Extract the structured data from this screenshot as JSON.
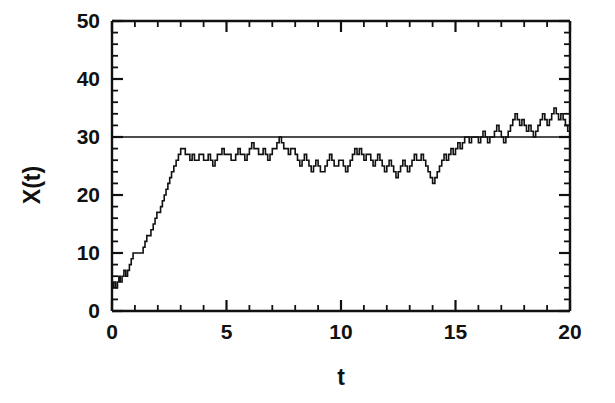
{
  "chart_data": {
    "type": "line",
    "title": "",
    "subtitle": "",
    "xlabel": "t",
    "ylabel": "X(t)",
    "xlim": [
      0,
      20
    ],
    "ylim": [
      0,
      50
    ],
    "xticks": [
      0,
      5,
      10,
      15,
      20
    ],
    "xtick_labels": [
      "0",
      "5",
      "10",
      "15",
      "20"
    ],
    "yticks": [
      0,
      10,
      20,
      30,
      40,
      50
    ],
    "ytick_labels": [
      "0",
      "10",
      "20",
      "30",
      "40",
      "50"
    ],
    "x_minor_tick_step": 1,
    "y_minor_tick_step": 2,
    "grid": false,
    "legend": "none",
    "line_color": "#111111",
    "line_width": 1.6,
    "step_style": "post",
    "annotations": [
      {
        "name": "equilibrium-line",
        "type": "hline",
        "y": 30,
        "label": "",
        "color": "#111111",
        "width": 1.6
      }
    ],
    "series": [
      {
        "name": "X(t)",
        "style": "step",
        "x": [
          0.0,
          0.08,
          0.16,
          0.24,
          0.3,
          0.36,
          0.44,
          0.52,
          0.6,
          0.68,
          0.76,
          0.84,
          0.92,
          1.0,
          1.08,
          1.18,
          1.28,
          1.36,
          1.44,
          1.52,
          1.6,
          1.7,
          1.8,
          1.88,
          1.96,
          2.04,
          2.12,
          2.2,
          2.28,
          2.36,
          2.44,
          2.52,
          2.6,
          2.7,
          2.8,
          2.9,
          3.0,
          3.1,
          3.2,
          3.3,
          3.4,
          3.5,
          3.6,
          3.7,
          3.8,
          3.9,
          4.0,
          4.1,
          4.2,
          4.3,
          4.4,
          4.5,
          4.6,
          4.7,
          4.8,
          4.9,
          5.0,
          5.1,
          5.2,
          5.3,
          5.4,
          5.5,
          5.6,
          5.7,
          5.8,
          5.9,
          6.0,
          6.1,
          6.2,
          6.3,
          6.4,
          6.5,
          6.6,
          6.7,
          6.8,
          6.9,
          7.0,
          7.1,
          7.2,
          7.3,
          7.4,
          7.5,
          7.6,
          7.7,
          7.8,
          7.9,
          8.0,
          8.1,
          8.2,
          8.3,
          8.4,
          8.5,
          8.6,
          8.7,
          8.8,
          8.9,
          9.0,
          9.1,
          9.2,
          9.3,
          9.4,
          9.5,
          9.6,
          9.7,
          9.8,
          9.9,
          10.0,
          10.1,
          10.2,
          10.3,
          10.4,
          10.5,
          10.6,
          10.7,
          10.8,
          10.9,
          11.0,
          11.1,
          11.2,
          11.3,
          11.4,
          11.5,
          11.6,
          11.7,
          11.8,
          11.9,
          12.0,
          12.1,
          12.2,
          12.3,
          12.4,
          12.5,
          12.6,
          12.7,
          12.8,
          12.9,
          13.0,
          13.1,
          13.2,
          13.3,
          13.4,
          13.5,
          13.6,
          13.7,
          13.8,
          13.9,
          14.0,
          14.1,
          14.2,
          14.3,
          14.4,
          14.5,
          14.6,
          14.7,
          14.8,
          14.9,
          15.0,
          15.1,
          15.2,
          15.3,
          15.4,
          15.5,
          15.6,
          15.7,
          15.8,
          15.9,
          16.0,
          16.1,
          16.2,
          16.3,
          16.4,
          16.5,
          16.6,
          16.7,
          16.8,
          16.9,
          17.0,
          17.1,
          17.2,
          17.3,
          17.4,
          17.5,
          17.6,
          17.7,
          17.8,
          17.9,
          18.0,
          18.1,
          18.2,
          18.3,
          18.4,
          18.5,
          18.6,
          18.7,
          18.8,
          18.9,
          19.0,
          19.1,
          19.2,
          19.3,
          19.4,
          19.5,
          19.6,
          19.7,
          19.8,
          19.9,
          20.0
        ],
        "y": [
          4,
          5,
          4,
          5,
          6,
          5,
          6,
          7,
          6,
          7,
          8,
          9,
          10,
          10,
          10,
          10,
          10,
          11,
          12,
          13,
          13,
          14,
          15,
          16,
          17,
          17,
          18,
          19,
          20,
          21,
          22,
          23,
          24,
          25,
          26,
          27,
          28,
          28,
          27,
          27,
          26,
          27,
          26,
          26,
          27,
          27,
          26,
          26,
          27,
          26,
          25,
          26,
          27,
          27,
          28,
          27,
          27,
          27,
          26,
          26,
          27,
          28,
          27,
          27,
          26,
          27,
          28,
          29,
          28,
          28,
          27,
          27,
          28,
          27,
          26,
          27,
          28,
          28,
          29,
          30,
          29,
          28,
          28,
          27,
          28,
          28,
          27,
          26,
          25,
          26,
          27,
          26,
          25,
          24,
          25,
          26,
          25,
          24,
          24,
          25,
          26,
          27,
          26,
          25,
          25,
          26,
          26,
          25,
          24,
          25,
          26,
          27,
          28,
          27,
          28,
          27,
          26,
          27,
          27,
          26,
          25,
          26,
          27,
          26,
          25,
          24,
          25,
          26,
          25,
          24,
          23,
          24,
          25,
          26,
          25,
          24,
          25,
          26,
          27,
          26,
          26,
          27,
          26,
          25,
          24,
          23,
          22,
          23,
          24,
          25,
          26,
          27,
          26,
          27,
          28,
          27,
          28,
          29,
          28,
          29,
          30,
          30,
          29,
          30,
          30,
          30,
          29,
          30,
          31,
          30,
          29,
          30,
          30,
          31,
          32,
          31,
          30,
          29,
          30,
          31,
          32,
          33,
          34,
          33,
          32,
          33,
          32,
          31,
          32,
          31,
          30,
          31,
          32,
          33,
          34,
          33,
          32,
          33,
          34,
          35,
          34,
          33,
          34,
          33,
          32,
          31,
          30
        ]
      }
    ]
  },
  "axes": {
    "x_axis_name": "time-axis",
    "y_axis_name": "value-axis",
    "frame_color": "#111111"
  }
}
